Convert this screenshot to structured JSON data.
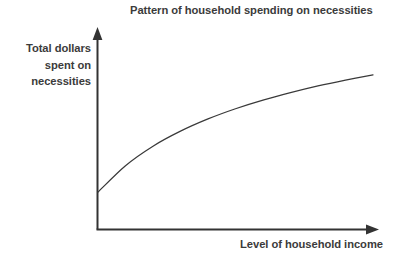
{
  "figure": {
    "background_color": "#ffffff",
    "width": 410,
    "height": 267
  },
  "title": "Pattern of household spending on necessities",
  "axes": {
    "y_label_lines": [
      "Total dollars",
      "spent on",
      "necessities"
    ],
    "y_label_line1": "Total dollars",
    "y_label_line2": "spent on",
    "y_label_line3": "necessities",
    "x_label": "Level of household income",
    "axis_color": "#333333",
    "curve_color": "#3a3a3a"
  },
  "chart_data": {
    "type": "line",
    "title": "Pattern of household spending on necessities",
    "xlabel": "Level of household income",
    "ylabel": "Total dollars spent on necessities",
    "xlim": [
      0,
      100
    ],
    "ylim": [
      0,
      100
    ],
    "grid": false,
    "legend": "none",
    "axis_arrows": true,
    "tick_labels_x": [],
    "tick_labels_y": [],
    "annotations": [],
    "series": [
      {
        "name": "Spending on necessities",
        "shape": "concave-down increasing (diminishing returns)",
        "x": [
          0,
          10,
          20,
          30,
          40,
          50,
          60,
          70,
          80,
          90,
          100
        ],
        "y": [
          21.7,
          37.0,
          48.3,
          57.0,
          64.1,
          70.0,
          75.0,
          79.3,
          83.2,
          86.6,
          89.7
        ]
      }
    ]
  }
}
